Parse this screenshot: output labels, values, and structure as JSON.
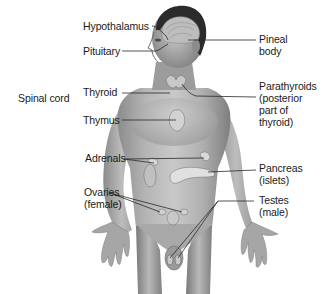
{
  "diagram": {
    "labels": {
      "hypothalamus": "Hypothalamus",
      "pituitary": "Pituitary",
      "spinal_cord": "Spinal cord",
      "thyroid": "Thyroid",
      "thymus": "Thymus",
      "adrenals": "Adrenals",
      "ovaries": "Ovaries\n(female)",
      "pineal_body": "Pineal\nbody",
      "parathyroids": "Parathyroids\n(posterior\npart of\nthyroid)",
      "pancreas": "Pancreas\n(islets)",
      "testes": "Testes\n(male)"
    },
    "colors": {
      "background": "#ffffff",
      "text": "#1a1a1a",
      "leader_line": "#2a2a2a",
      "skin_light": "#d4d4d4",
      "skin_mid": "#a8a8a8",
      "skin_dark": "#6e6e6e",
      "hair": "#2b2b2b",
      "organ": "#e6e6e6"
    }
  }
}
